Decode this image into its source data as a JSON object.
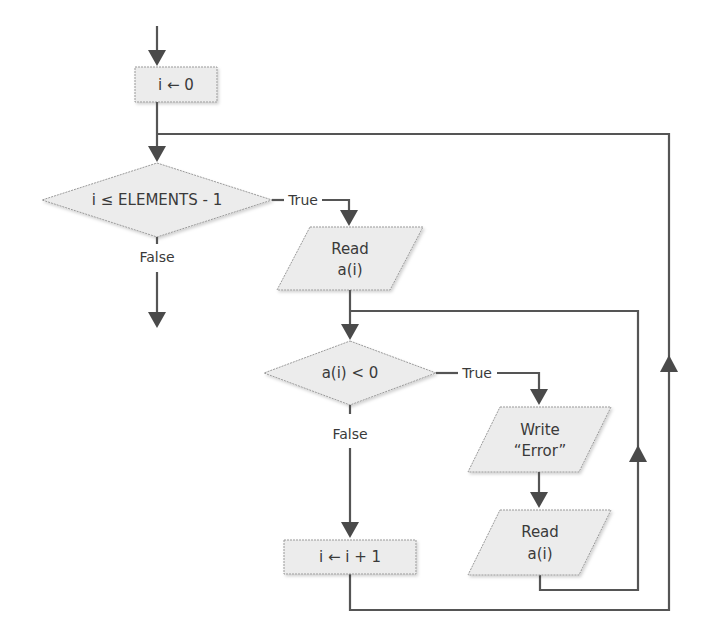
{
  "flowchart": {
    "nodes": {
      "init": {
        "type": "process",
        "text": "i ← 0"
      },
      "loop_condition": {
        "type": "decision",
        "text": "i ≤ ELEMENTS - 1"
      },
      "read_first": {
        "type": "io",
        "line1": "Read",
        "line2": "a(i)"
      },
      "check_negative": {
        "type": "decision",
        "text": "a(i) < 0"
      },
      "write_error": {
        "type": "io",
        "line1": "Write",
        "line2": "“Error”"
      },
      "read_again": {
        "type": "io",
        "line1": "Read",
        "line2": "a(i)"
      },
      "increment": {
        "type": "process",
        "text": "i ← i + 1"
      }
    },
    "edge_labels": {
      "loop_true": "True",
      "loop_false": "False",
      "neg_true": "True",
      "neg_false": "False"
    },
    "colors": {
      "shape_fill": "#ececec",
      "shape_border": "#9a9a9a",
      "line": "#555555",
      "text": "#3a3a3a"
    }
  }
}
